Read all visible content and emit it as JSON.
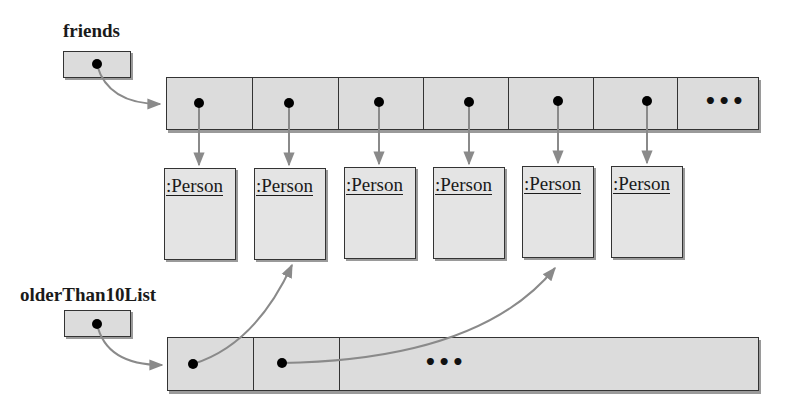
{
  "diagram": {
    "friends": {
      "label": "friends",
      "array_cells": 7,
      "ellipsis": "•••",
      "elements": [
        ":Person",
        ":Person",
        ":Person",
        ":Person",
        ":Person",
        ":Person"
      ]
    },
    "olderThan10List": {
      "label": "olderThan10List",
      "array_cells": 3,
      "ellipsis": "•••",
      "references_person_indices": [
        1,
        4
      ]
    },
    "colors": {
      "box_fill": "#dcdcdc",
      "person_fill": "#e4e4e4",
      "border": "#333333",
      "arrow": "#8a8a8a",
      "dot": "#000000"
    }
  }
}
